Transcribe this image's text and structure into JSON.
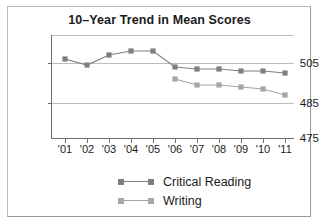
{
  "chart_data": {
    "type": "line",
    "title": "10–Year Trend in Mean Scores",
    "xlabel": "",
    "ylabel": "",
    "categories": [
      "'01",
      "'02",
      "'03",
      "'04",
      "'05",
      "'06",
      "'07",
      "'08",
      "'09",
      "'10",
      "'11"
    ],
    "ytick_labels": [
      "505",
      "485",
      "475"
    ],
    "ytick_values": [
      505,
      485,
      475
    ],
    "ylim": [
      475,
      512
    ],
    "grid": true,
    "legend_position": "bottom",
    "series": [
      {
        "name": "Critical Reading",
        "color": "#808080",
        "values": [
          506,
          504,
          507,
          508,
          508,
          503,
          502,
          502,
          501,
          501,
          500
        ]
      },
      {
        "name": "Writing",
        "color": "#a6a6a6",
        "values": [
          null,
          null,
          null,
          null,
          null,
          497,
          494,
          494,
          493,
          492,
          489
        ]
      }
    ]
  },
  "legend": {
    "items": [
      {
        "label": "Critical Reading",
        "color": "#808080"
      },
      {
        "label": "Writing",
        "color": "#a6a6a6"
      }
    ]
  },
  "colors": {
    "critical_reading": "#808080",
    "writing": "#a6a6a6",
    "axis": "#6e6e6e",
    "grid": "#bcbcbc",
    "text": "#1b1b1b",
    "frame": "#b9b9b9",
    "background": "#ffffff"
  }
}
